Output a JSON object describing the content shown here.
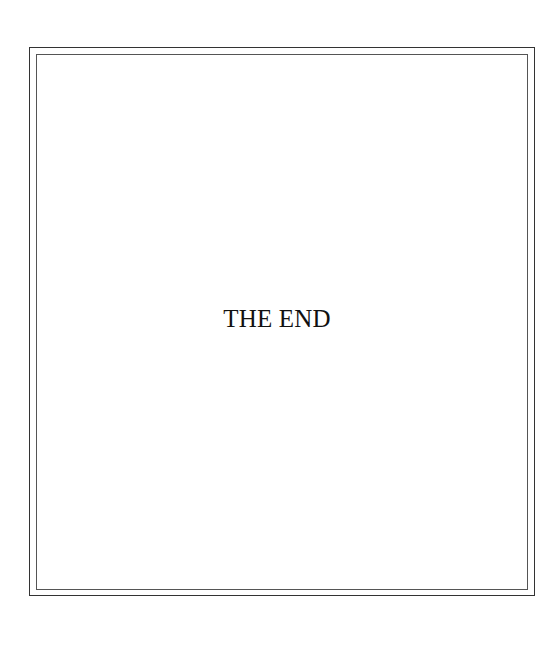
{
  "page": {
    "text": "THE END",
    "colors": {
      "background": "#ffffff",
      "border_outer": "#333333",
      "border_inner": "#555555",
      "text": "#111111"
    }
  }
}
